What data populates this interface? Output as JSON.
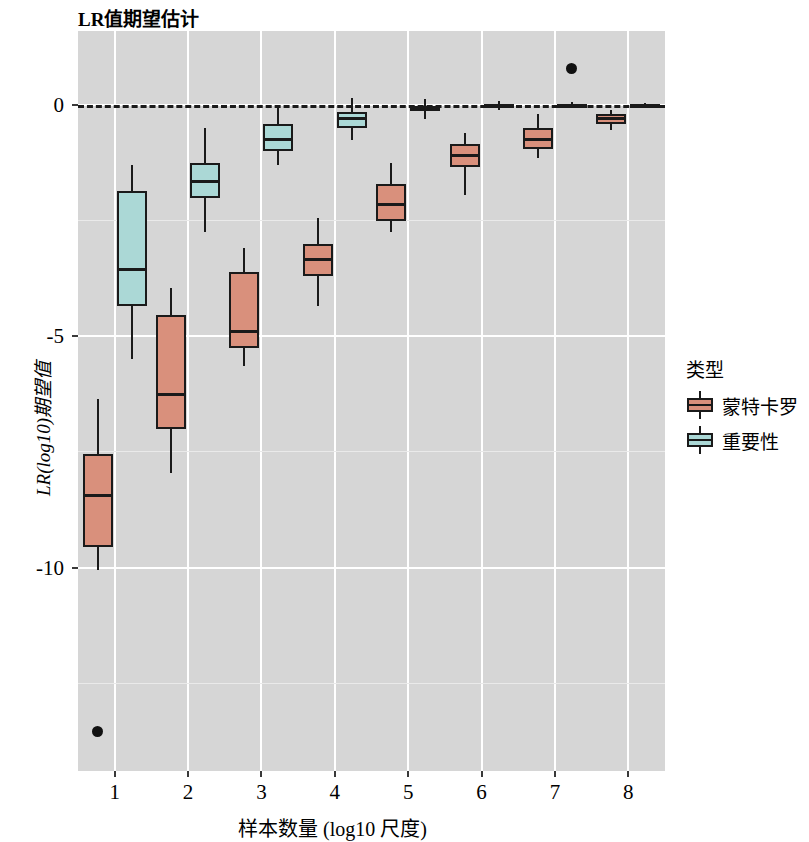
{
  "chart": {
    "title": "LR值期望估计",
    "xlabel": "样本数量 (log10 尺度)",
    "ylabel": "LR(log10)期望值"
  },
  "legend": {
    "title": "类型",
    "items": [
      {
        "label": "蒙特卡罗",
        "color": "#d9907c"
      },
      {
        "label": "重要性",
        "color": "#abd8d6"
      }
    ]
  },
  "axes": {
    "y_ticks": [
      "0",
      "-5",
      "-10"
    ],
    "x_ticks": [
      "1",
      "2",
      "3",
      "4",
      "5",
      "6",
      "7",
      "8"
    ]
  },
  "chart_data": {
    "type": "box",
    "title": "LR值期望估计",
    "xlabel": "样本数量 (log10 尺度)",
    "ylabel": "LR(log10)期望值",
    "xlim": [
      0.5,
      8.5
    ],
    "ylim": [
      -14.4,
      1.6
    ],
    "y_ticks": [
      0,
      -5,
      -10
    ],
    "x_categories": [
      1,
      2,
      3,
      4,
      5,
      6,
      7,
      8
    ],
    "grid": true,
    "legend_position": "right",
    "reference_line": {
      "y": 0,
      "style": "dashed",
      "color": "#1a1a1a"
    },
    "series": [
      {
        "name": "蒙特卡罗",
        "color": "#d9907c",
        "boxes": [
          {
            "x": 1,
            "whisker_low": -10.05,
            "q1": -9.55,
            "median": -8.45,
            "q3": -7.55,
            "whisker_high": -6.35,
            "outliers": [
              -13.55
            ]
          },
          {
            "x": 2,
            "whisker_low": -7.95,
            "q1": -7.0,
            "median": -6.25,
            "q3": -4.55,
            "whisker_high": -3.95,
            "outliers": []
          },
          {
            "x": 3,
            "whisker_low": -5.65,
            "q1": -5.25,
            "median": -4.9,
            "q3": -3.6,
            "whisker_high": -3.1,
            "outliers": []
          },
          {
            "x": 4,
            "whisker_low": -4.35,
            "q1": -3.7,
            "median": -3.35,
            "q3": -3.0,
            "whisker_high": -2.45,
            "outliers": []
          },
          {
            "x": 5,
            "whisker_low": -2.75,
            "q1": -2.5,
            "median": -2.15,
            "q3": -1.7,
            "whisker_high": -1.25,
            "outliers": []
          },
          {
            "x": 6,
            "whisker_low": -1.95,
            "q1": -1.35,
            "median": -1.1,
            "q3": -0.85,
            "whisker_high": -0.6,
            "outliers": []
          },
          {
            "x": 7,
            "whisker_low": -1.15,
            "q1": -0.95,
            "median": -0.75,
            "q3": -0.5,
            "whisker_high": -0.2,
            "outliers": []
          },
          {
            "x": 8,
            "whisker_low": -0.55,
            "q1": -0.4,
            "median": -0.3,
            "q3": -0.2,
            "whisker_high": -0.1,
            "outliers": []
          }
        ]
      },
      {
        "name": "重要性",
        "color": "#abd8d6",
        "boxes": [
          {
            "x": 1,
            "whisker_low": -5.5,
            "q1": -4.35,
            "median": -3.55,
            "q3": -1.85,
            "whisker_high": -1.3,
            "outliers": []
          },
          {
            "x": 2,
            "whisker_low": -2.75,
            "q1": -2.0,
            "median": -1.65,
            "q3": -1.25,
            "whisker_high": -0.5,
            "outliers": []
          },
          {
            "x": 3,
            "whisker_low": -1.3,
            "q1": -1.0,
            "median": -0.75,
            "q3": -0.4,
            "whisker_high": -0.05,
            "outliers": []
          },
          {
            "x": 4,
            "whisker_low": -0.75,
            "q1": -0.5,
            "median": -0.3,
            "q3": -0.15,
            "whisker_high": 0.15,
            "outliers": []
          },
          {
            "x": 5,
            "whisker_low": -0.3,
            "q1": -0.13,
            "median": -0.08,
            "q3": -0.02,
            "whisker_high": 0.12,
            "outliers": []
          },
          {
            "x": 6,
            "whisker_low": -0.1,
            "q1": -0.05,
            "median": -0.02,
            "q3": 0.02,
            "whisker_high": 0.08,
            "outliers": []
          },
          {
            "x": 7,
            "whisker_low": -0.06,
            "q1": -0.03,
            "median": 0.0,
            "q3": 0.03,
            "whisker_high": 0.06,
            "outliers": [
              0.78
            ]
          },
          {
            "x": 8,
            "whisker_low": -0.05,
            "q1": -0.02,
            "median": 0.0,
            "q3": 0.02,
            "whisker_high": 0.05,
            "outliers": []
          }
        ]
      }
    ]
  }
}
